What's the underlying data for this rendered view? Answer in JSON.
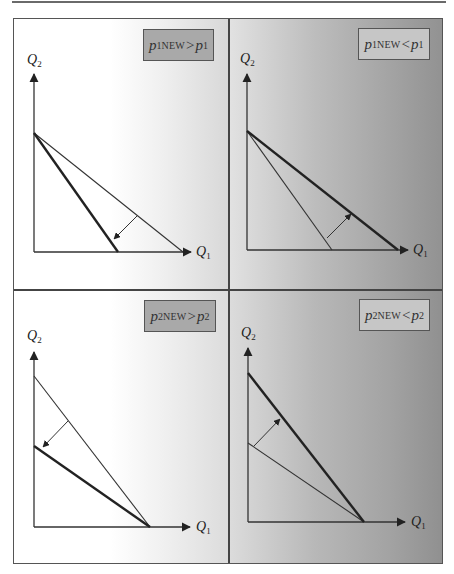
{
  "figure": {
    "panels": [
      {
        "id": "top-left",
        "label": {
          "p": "p",
          "sub": "1NEW",
          "op": ">",
          "rhs_p": "p",
          "rhs_sub": "1"
        },
        "label_box_color": "#a9a9a9",
        "axis": {
          "x_label": "Q",
          "x_sub": "1",
          "y_label": "Q",
          "y_sub": "2"
        },
        "old_line": "thin, intercepts Q2 high and Q1 far",
        "new_line": "thick, same Q2 intercept, smaller Q1 intercept",
        "shift_direction": "inward (rotate toward origin on Q1 axis)"
      },
      {
        "id": "top-right",
        "label": {
          "p": "p",
          "sub": "1NEW",
          "op": "<",
          "rhs_p": "p",
          "rhs_sub": "1"
        },
        "label_box_color": "#c6c6c6",
        "axis": {
          "x_label": "Q",
          "x_sub": "1",
          "y_label": "Q",
          "y_sub": "2"
        },
        "old_line": "thin, same Q2 intercept, smaller Q1 intercept",
        "new_line": "thick, larger Q1 intercept",
        "shift_direction": "outward (rotate away on Q1 axis)"
      },
      {
        "id": "bottom-left",
        "label": {
          "p": "p",
          "sub": "2NEW",
          "op": ">",
          "rhs_p": "p",
          "rhs_sub": "2"
        },
        "label_box_color": "#a9a9a9",
        "axis": {
          "x_label": "Q",
          "x_sub": "1",
          "y_label": "Q",
          "y_sub": "2"
        },
        "old_line": "thin, high Q2 intercept",
        "new_line": "thick, lower Q2 intercept, same Q1 intercept",
        "shift_direction": "inward (rotate toward origin on Q2 axis)"
      },
      {
        "id": "bottom-right",
        "label": {
          "p": "p",
          "sub": "2NEW",
          "op": "<",
          "rhs_p": "p",
          "rhs_sub": "2"
        },
        "label_box_color": "#c6c6c6",
        "axis": {
          "x_label": "Q",
          "x_sub": "1",
          "y_label": "Q",
          "y_sub": "2"
        },
        "old_line": "thin, low Q2 intercept",
        "new_line": "thick, higher Q2 intercept, same Q1 intercept",
        "shift_direction": "outward (rotate away on Q2 axis)"
      }
    ]
  }
}
